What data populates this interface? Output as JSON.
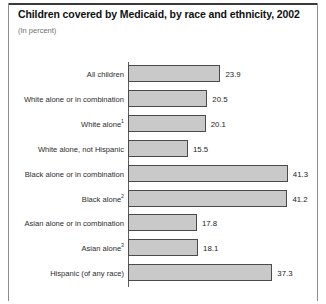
{
  "header": {
    "title": "Children covered by Medicaid, by race and ethnicity, 2002",
    "subtitle": "(In percent)"
  },
  "chart_data": {
    "type": "bar",
    "orientation": "horizontal",
    "title": "Children covered by Medicaid, by race and ethnicity, 2002",
    "subtitle": "(In percent)",
    "xlabel": "",
    "ylabel": "",
    "xlim": [
      0,
      45
    ],
    "grid": false,
    "legend": null,
    "bar_fill_color": "#c9c9c9",
    "bar_border_color": "#4a4a4a",
    "categories": [
      "All children",
      "White alone or in combination",
      "White alone",
      "White alone, not Hispanic",
      "Black alone or in combination",
      "Black alone",
      "Asian alone or in combination",
      "Asian alone",
      "Hispanic (of any race)"
    ],
    "footnote_markers": [
      "",
      "",
      "1",
      "",
      "",
      "2",
      "",
      "3",
      ""
    ],
    "values": [
      23.9,
      20.5,
      20.1,
      15.5,
      41.3,
      41.2,
      17.8,
      18.1,
      37.3
    ],
    "value_labels": [
      "23.9",
      "20.5",
      "20.1",
      "15.5",
      "41.3",
      "41.2",
      "17.8",
      "18.1",
      "37.3"
    ]
  }
}
